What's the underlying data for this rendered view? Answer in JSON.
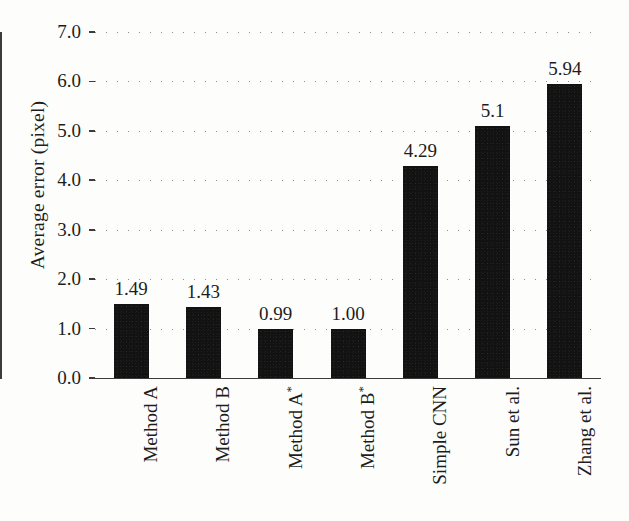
{
  "chart_data": {
    "type": "bar",
    "title": "",
    "xlabel": "",
    "ylabel": "Average error (pixel)",
    "ylim": [
      0.0,
      7.0
    ],
    "ytick_labels": [
      "0.0",
      "1.0",
      "2.0",
      "3.0",
      "4.0",
      "5.0",
      "6.0",
      "7.0"
    ],
    "ytick_values": [
      0.0,
      1.0,
      2.0,
      3.0,
      4.0,
      5.0,
      6.0,
      7.0
    ],
    "grid": "horizontal-dotted",
    "legend": "none",
    "bar_color": "#121212",
    "categories": [
      "Method A",
      "Method B",
      "Method A*",
      "Method B*",
      "Simple CNN",
      "Sun et al.",
      "Zhang et al."
    ],
    "values": [
      1.49,
      1.43,
      0.99,
      1.0,
      4.29,
      5.1,
      5.94
    ],
    "value_labels": [
      "1.49",
      "1.43",
      "0.99",
      "1.00",
      "4.29",
      "5.1",
      "5.94"
    ],
    "bars": [
      {
        "category": "Method A",
        "base": "Method A",
        "star": false,
        "value": 1.49,
        "label": "1.49"
      },
      {
        "category": "Method B",
        "base": "Method B",
        "star": false,
        "value": 1.43,
        "label": "1.43"
      },
      {
        "category": "Method A*",
        "base": "Method A",
        "star": true,
        "value": 0.99,
        "label": "0.99"
      },
      {
        "category": "Method B*",
        "base": "Method B",
        "star": true,
        "value": 1.0,
        "label": "1.00"
      },
      {
        "category": "Simple CNN",
        "base": "Simple CNN",
        "star": false,
        "value": 4.29,
        "label": "4.29"
      },
      {
        "category": "Sun et al.",
        "base": "Sun et al.",
        "star": false,
        "value": 5.1,
        "label": "5.1"
      },
      {
        "category": "Zhang et al.",
        "base": "Zhang et al.",
        "star": false,
        "value": 5.94,
        "label": "5.94"
      }
    ]
  }
}
